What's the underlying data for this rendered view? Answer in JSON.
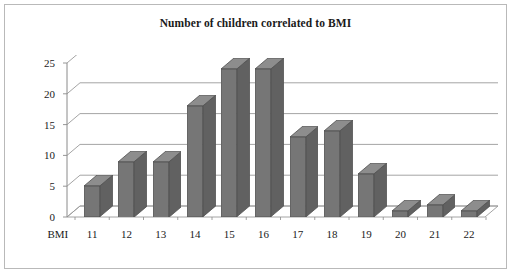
{
  "chart_data": {
    "type": "bar",
    "title": "Number of children correlated to BMI",
    "xlabel": "BMI",
    "ylabel": "",
    "categories": [
      "11",
      "12",
      "13",
      "14",
      "15",
      "16",
      "17",
      "18",
      "19",
      "20",
      "21",
      "22"
    ],
    "values": [
      5,
      9,
      9,
      18,
      24,
      24,
      13,
      14,
      7,
      1,
      2,
      1
    ],
    "ylim": [
      0,
      25
    ],
    "yticks": [
      0,
      5,
      10,
      15,
      20,
      25
    ],
    "ytick_labels": [
      "0",
      "5",
      "10",
      "15",
      "20",
      "25"
    ],
    "grid": true,
    "legend": false,
    "style_3d": true,
    "axis_category_label": "BMI",
    "colors": {
      "bar_front": "#767676",
      "bar_top": "#8d8d8d",
      "bar_side": "#616161",
      "bar_outline": "#4f4f4f",
      "gridline": "#9a9a9a",
      "axis": "#8a8a8a",
      "border": "#b9b9b9",
      "background": "#ffffff",
      "text": "#1a1a1a"
    }
  }
}
